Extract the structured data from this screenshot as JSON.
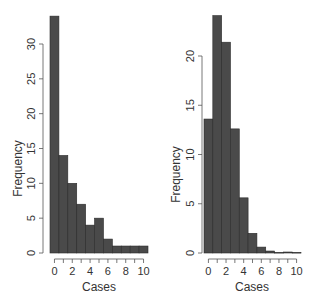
{
  "chart_data": [
    {
      "type": "bar",
      "title": "",
      "xlabel": "Cases",
      "ylabel": "Frequency",
      "categories": [
        0,
        1,
        2,
        3,
        4,
        5,
        6,
        7,
        8,
        9,
        10
      ],
      "values": [
        34,
        14,
        10,
        7,
        4,
        5,
        2,
        1,
        1,
        1,
        1
      ],
      "xticks": [
        "0",
        "2",
        "4",
        "6",
        "8",
        "10"
      ],
      "yticks": [
        "0",
        "5",
        "10",
        "15",
        "20",
        "25",
        "30"
      ],
      "ylim": [
        0,
        34
      ],
      "grid": false,
      "bar_color": "#4a4a4a"
    },
    {
      "type": "bar",
      "title": "",
      "xlabel": "Cases",
      "ylabel": "Frequency",
      "categories": [
        0,
        1,
        2,
        3,
        4,
        5,
        6,
        7,
        8,
        9,
        10
      ],
      "values": [
        13.6,
        24.1,
        21.4,
        12.6,
        5.6,
        2.0,
        0.6,
        0.2,
        0.05,
        0.1,
        0.05
      ],
      "xticks": [
        "0",
        "2",
        "4",
        "6",
        "8",
        "10"
      ],
      "yticks": [
        "0",
        "5",
        "10",
        "15",
        "20"
      ],
      "ylim": [
        0,
        24.1
      ],
      "grid": false,
      "bar_color": "#4a4a4a"
    }
  ]
}
